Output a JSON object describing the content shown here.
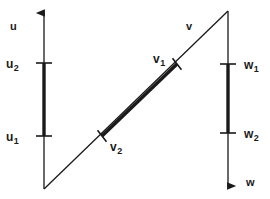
{
  "figure": {
    "width": 270,
    "height": 199,
    "background_color": "#ffffff",
    "stroke_color": "#1a1a1a",
    "thin_stroke_width": 1.2,
    "thick_stroke_width": 3.2
  },
  "axes": [
    {
      "id": "u",
      "name": "u",
      "label": "u",
      "orientation": "vertical",
      "arrow_direction": "up",
      "x": 44,
      "top_y": 9,
      "bottom_y": 189,
      "label_x": 10,
      "label_y": 18
    },
    {
      "id": "v",
      "name": "v",
      "label": "v",
      "orientation": "diagonal",
      "arrow_direction": "none",
      "x1": 44,
      "y1": 189,
      "x2": 228,
      "y2": 11,
      "label_x": 186,
      "label_y": 18
    },
    {
      "id": "w",
      "name": "w",
      "label": "w",
      "orientation": "vertical",
      "arrow_direction": "down",
      "x": 228,
      "top_y": 11,
      "bottom_y": 191,
      "label_x": 246,
      "label_y": 174
    }
  ],
  "ticks": [
    {
      "id": "u2",
      "base": "u",
      "subscript": "2",
      "axis": "u",
      "x": 44,
      "y": 63,
      "half_length": 7,
      "label_x": 6,
      "label_y": 56,
      "label_anchor": "left"
    },
    {
      "id": "u1",
      "base": "u",
      "subscript": "1",
      "axis": "u",
      "x": 44,
      "y": 136,
      "half_length": 7,
      "label_x": 6,
      "label_y": 129,
      "label_anchor": "left"
    },
    {
      "id": "v1",
      "base": "v",
      "subscript": "1",
      "axis": "v",
      "x": 177,
      "y": 64,
      "half_length": 7,
      "label_x": 153,
      "label_y": 51,
      "label_anchor": "left"
    },
    {
      "id": "v2",
      "base": "v",
      "subscript": "2",
      "axis": "v",
      "x": 102,
      "y": 136,
      "half_length": 7,
      "label_x": 110,
      "label_y": 139,
      "label_anchor": "left"
    },
    {
      "id": "w1",
      "base": "w",
      "subscript": "1",
      "axis": "w",
      "x": 228,
      "y": 64,
      "half_length": 7,
      "label_x": 244,
      "label_y": 57,
      "label_anchor": "left"
    },
    {
      "id": "w2",
      "base": "w",
      "subscript": "2",
      "axis": "w",
      "x": 228,
      "y": 133,
      "half_length": 7,
      "label_x": 244,
      "label_y": 126,
      "label_anchor": "left"
    }
  ],
  "intervals": [
    {
      "id": "u-interval",
      "axis": "u",
      "from_tick": "u1",
      "to_tick": "u2",
      "x1": 44,
      "y1": 63,
      "x2": 44,
      "y2": 136
    },
    {
      "id": "v-interval",
      "axis": "v",
      "from_tick": "v2",
      "to_tick": "v1",
      "x1": 102,
      "y1": 136,
      "x2": 177,
      "y2": 64
    },
    {
      "id": "w-interval",
      "axis": "w",
      "from_tick": "w1",
      "to_tick": "w2",
      "x1": 228,
      "y1": 64,
      "x2": 228,
      "y2": 133
    }
  ]
}
